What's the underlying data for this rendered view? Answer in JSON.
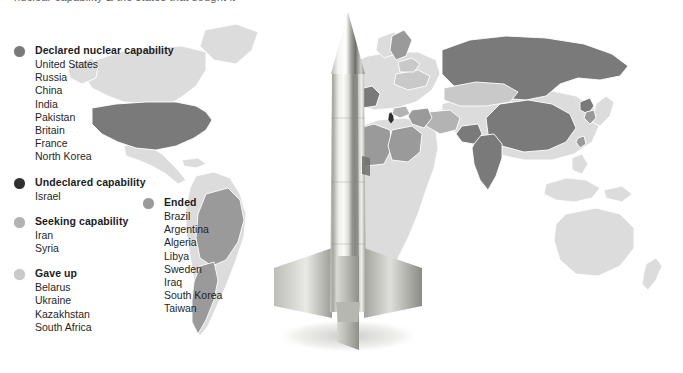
{
  "page": {
    "cut_off_headline": "nuclear capability   &   the states that sought it",
    "background_color": "#ffffff"
  },
  "graphic": {
    "rocket_alt": "missile-illustration",
    "map_alt": "world-map-nuclear-capability"
  },
  "colors": {
    "declared": "#7a7a7a",
    "undeclared": "#2f2f2f",
    "seeking": "#b3b3b3",
    "gave_up": "#c9c9c9",
    "ended": "#9a9a9a",
    "map_base": "#dcdcdc",
    "map_border": "#ffffff",
    "text": "#1f1f1f",
    "heading": "#1c1c1c"
  },
  "legend": {
    "left_groups": [
      {
        "id": "declared",
        "label": "Declared nuclear capability",
        "dot_color": "#7a7a7a",
        "countries": [
          "United States",
          "Russia",
          "China",
          "India",
          "Pakistan",
          "Britain",
          "France",
          "North Korea"
        ]
      },
      {
        "id": "undeclared",
        "label": "Undeclared capability",
        "dot_color": "#2f2f2f",
        "countries": [
          "Israel"
        ]
      },
      {
        "id": "seeking",
        "label": "Seeking capability",
        "dot_color": "#b3b3b3",
        "countries": [
          "Iran",
          "Syria"
        ]
      },
      {
        "id": "gave-up",
        "label": "Gave up",
        "dot_color": "#c9c9c9",
        "countries": [
          "Belarus",
          "Ukraine",
          "Kazakhstan",
          "South Africa"
        ]
      }
    ],
    "right_groups": [
      {
        "id": "ended",
        "label": "Ended",
        "dot_color": "#9a9a9a",
        "countries": [
          "Brazil",
          "Argentina",
          "Algeria",
          "Libya",
          "Sweden",
          "Iraq",
          "South Korea",
          "Taiwan"
        ]
      }
    ]
  },
  "map_data": {
    "type": "choropleth",
    "categories": [
      "Declared nuclear capability",
      "Undeclared capability",
      "Seeking capability",
      "Gave up",
      "Ended",
      "No programme"
    ],
    "country_status": [
      {
        "country": "United States",
        "status": "Declared nuclear capability"
      },
      {
        "country": "Russia",
        "status": "Declared nuclear capability"
      },
      {
        "country": "China",
        "status": "Declared nuclear capability"
      },
      {
        "country": "India",
        "status": "Declared nuclear capability"
      },
      {
        "country": "Pakistan",
        "status": "Declared nuclear capability"
      },
      {
        "country": "Britain",
        "status": "Declared nuclear capability"
      },
      {
        "country": "France",
        "status": "Declared nuclear capability"
      },
      {
        "country": "North Korea",
        "status": "Declared nuclear capability"
      },
      {
        "country": "Israel",
        "status": "Undeclared capability"
      },
      {
        "country": "Iran",
        "status": "Seeking capability"
      },
      {
        "country": "Syria",
        "status": "Seeking capability"
      },
      {
        "country": "Belarus",
        "status": "Gave up"
      },
      {
        "country": "Ukraine",
        "status": "Gave up"
      },
      {
        "country": "Kazakhstan",
        "status": "Gave up"
      },
      {
        "country": "South Africa",
        "status": "Gave up"
      },
      {
        "country": "Brazil",
        "status": "Ended"
      },
      {
        "country": "Argentina",
        "status": "Ended"
      },
      {
        "country": "Algeria",
        "status": "Ended"
      },
      {
        "country": "Libya",
        "status": "Ended"
      },
      {
        "country": "Sweden",
        "status": "Ended"
      },
      {
        "country": "Iraq",
        "status": "Ended"
      },
      {
        "country": "South Korea",
        "status": "Ended"
      },
      {
        "country": "Taiwan",
        "status": "Ended"
      }
    ]
  }
}
